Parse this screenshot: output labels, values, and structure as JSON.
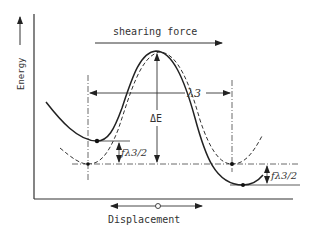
{
  "diagram": {
    "y_axis_label": "Energy",
    "x_axis_label": "Displacement",
    "top_label": "shearing force",
    "period_label": "λ3",
    "barrier_label": "ΔE",
    "left_shift_label": "fλ3/2",
    "right_shift_label": "fλ3/2",
    "colors": {
      "ink": "#222222",
      "text": "#333333",
      "background": "#ffffff"
    },
    "curves": [
      {
        "name": "solid-curve",
        "style": "solid",
        "description": "potential with applied shearing force (tilted)"
      },
      {
        "name": "dashed-curve",
        "style": "dashed",
        "description": "unperturbed periodic potential"
      }
    ],
    "markers": {
      "displacement_origin": "open-circle",
      "minima_points": 4
    }
  }
}
